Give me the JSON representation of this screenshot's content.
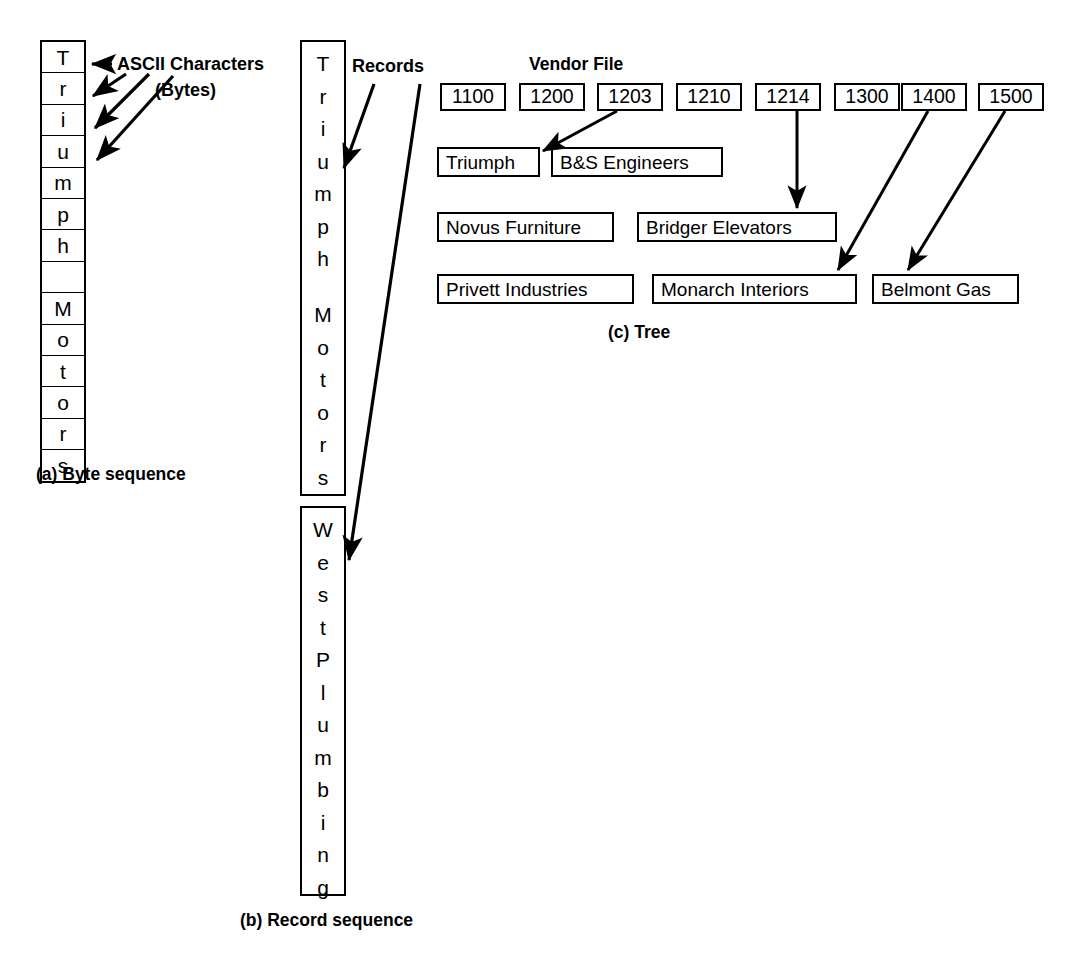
{
  "figure": {
    "panel_a": {
      "caption": "(a) Byte sequence",
      "annotation_line1": "ASCII Characters",
      "annotation_line2": "(Bytes)",
      "bytes": [
        "T",
        "r",
        "i",
        "u",
        "m",
        "p",
        "h",
        " ",
        "M",
        "o",
        "t",
        "o",
        "r",
        "s"
      ]
    },
    "panel_b": {
      "caption": "(b) Record sequence",
      "annotation": "Records",
      "records": [
        {
          "chars": [
            "T",
            "r",
            "i",
            "u",
            "m",
            "p",
            "h",
            " ",
            "M",
            "o",
            "t",
            "o",
            "r",
            "s"
          ]
        },
        {
          "chars": [
            "W",
            "e",
            "s",
            "t",
            " ",
            "P",
            "l",
            "u",
            "m",
            "b",
            "i",
            "n",
            "g"
          ]
        }
      ]
    },
    "panel_c": {
      "caption": "(c) Tree",
      "title": "Vendor File",
      "keys": [
        "1100",
        "1200",
        "1203",
        "1210",
        "1214",
        "1300",
        "1400",
        "1500"
      ],
      "names": [
        "Triumph",
        "B&S Engineers",
        "Novus Furniture",
        "Bridger Elevators",
        "Privett Industries",
        "Monarch Interiors",
        "Belmont Gas"
      ],
      "links": [
        {
          "from": "1203",
          "to": "Triumph"
        },
        {
          "from": "1214",
          "to": "Bridger Elevators"
        },
        {
          "from": "1400",
          "to": "Monarch Interiors"
        },
        {
          "from": "1500",
          "to": "Belmont Gas"
        }
      ]
    },
    "colors": {
      "ink": "#000000",
      "background": "#ffffff"
    }
  }
}
